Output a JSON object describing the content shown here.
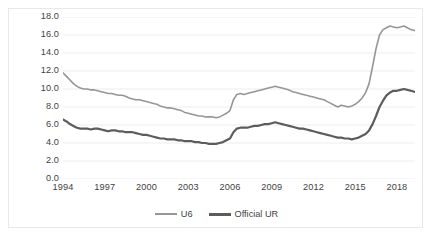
{
  "chart_data": {
    "type": "line",
    "title": "",
    "subtitle": "",
    "xlabel": "",
    "ylabel": "",
    "xlim": [
      1994.0,
      2019.3
    ],
    "ylim": [
      0.0,
      18.0
    ],
    "grid": true,
    "grid_axis": "y",
    "legend_position": "bottom",
    "x_tick_labels": [
      "1994",
      "1997",
      "2000",
      "2003",
      "2006",
      "2009",
      "2012",
      "2015",
      "2018"
    ],
    "x_tick_values": [
      1994,
      1997,
      2000,
      2003,
      2006,
      2009,
      2012,
      2015,
      2018
    ],
    "y_tick_labels": [
      "0.0",
      "2.0",
      "4.0",
      "6.0",
      "8.0",
      "10.0",
      "12.0",
      "14.0",
      "16.0",
      "18.0"
    ],
    "y_tick_values": [
      0.0,
      2.0,
      4.0,
      6.0,
      8.0,
      10.0,
      12.0,
      14.0,
      16.0,
      18.0
    ],
    "x_step": 0.25,
    "x_start": 1994.0,
    "series": [
      {
        "name": "U6",
        "color": "#969696",
        "width": 1.6,
        "values": [
          11.8,
          11.4,
          11.0,
          10.6,
          10.3,
          10.1,
          10.0,
          10.0,
          9.9,
          9.9,
          9.8,
          9.7,
          9.6,
          9.5,
          9.5,
          9.4,
          9.3,
          9.3,
          9.2,
          9.0,
          8.9,
          8.8,
          8.8,
          8.7,
          8.6,
          8.5,
          8.4,
          8.3,
          8.1,
          8.0,
          7.9,
          7.9,
          7.8,
          7.7,
          7.6,
          7.4,
          7.3,
          7.2,
          7.1,
          7.0,
          7.0,
          6.9,
          6.9,
          6.9,
          6.8,
          6.9,
          7.1,
          7.3,
          7.6,
          8.8,
          9.4,
          9.5,
          9.4,
          9.5,
          9.6,
          9.7,
          9.8,
          9.9,
          10.0,
          10.1,
          10.2,
          10.3,
          10.2,
          10.1,
          10.0,
          9.9,
          9.7,
          9.6,
          9.5,
          9.4,
          9.3,
          9.2,
          9.1,
          9.0,
          8.9,
          8.8,
          8.6,
          8.4,
          8.2,
          8.0,
          8.2,
          8.1,
          8.0,
          8.1,
          8.3,
          8.6,
          9.0,
          9.6,
          10.6,
          12.5,
          14.5,
          16.0,
          16.6,
          16.8,
          17.0,
          16.9,
          16.8,
          16.9,
          17.0,
          16.8,
          16.6,
          16.5,
          16.4,
          16.3,
          16.2,
          16.0,
          15.7,
          15.5,
          15.3,
          15.2,
          15.0,
          14.8,
          14.6,
          14.5,
          14.4,
          14.3,
          14.1,
          13.9,
          13.7,
          13.5,
          13.3,
          13.1,
          12.9,
          12.7,
          12.5,
          12.2,
          12.0,
          11.8,
          11.5,
          11.3,
          11.1,
          11.0,
          10.9,
          10.7,
          10.5,
          10.3,
          10.2,
          10.0,
          9.9,
          9.8,
          9.7,
          9.6,
          9.5,
          9.4,
          9.3,
          9.1,
          9.0,
          8.9,
          8.8,
          8.6,
          8.5,
          8.3,
          8.2,
          8.1,
          8.0,
          7.9,
          7.8,
          7.7,
          7.6,
          7.5,
          7.4,
          7.3,
          7.3,
          7.5,
          7.3,
          7.1,
          7.0,
          7.2
        ]
      },
      {
        "name": "Official UR",
        "color": "#5c5c5c",
        "width": 2.2,
        "values": [
          6.6,
          6.4,
          6.1,
          5.9,
          5.7,
          5.6,
          5.6,
          5.6,
          5.5,
          5.6,
          5.6,
          5.5,
          5.4,
          5.3,
          5.4,
          5.4,
          5.3,
          5.3,
          5.2,
          5.2,
          5.2,
          5.1,
          5.0,
          4.9,
          4.9,
          4.8,
          4.7,
          4.6,
          4.5,
          4.5,
          4.4,
          4.4,
          4.4,
          4.3,
          4.3,
          4.2,
          4.2,
          4.2,
          4.1,
          4.1,
          4.0,
          4.0,
          3.9,
          3.9,
          3.9,
          4.0,
          4.1,
          4.3,
          4.5,
          5.2,
          5.6,
          5.7,
          5.7,
          5.7,
          5.8,
          5.9,
          5.9,
          6.0,
          6.1,
          6.1,
          6.2,
          6.3,
          6.2,
          6.1,
          6.0,
          5.9,
          5.8,
          5.7,
          5.6,
          5.6,
          5.5,
          5.4,
          5.3,
          5.2,
          5.1,
          5.0,
          4.9,
          4.8,
          4.7,
          4.6,
          4.6,
          4.5,
          4.5,
          4.4,
          4.5,
          4.6,
          4.8,
          5.0,
          5.4,
          6.1,
          7.0,
          8.0,
          8.7,
          9.3,
          9.6,
          9.8,
          9.8,
          9.9,
          10.0,
          9.9,
          9.8,
          9.7,
          9.6,
          9.5,
          9.5,
          9.5,
          9.4,
          9.6,
          9.5,
          9.3,
          9.1,
          9.0,
          8.9,
          8.7,
          8.6,
          8.5,
          8.3,
          8.2,
          8.2,
          8.1,
          8.1,
          8.0,
          7.9,
          7.8,
          7.7,
          7.6,
          7.5,
          7.4,
          7.3,
          7.2,
          7.0,
          6.9,
          6.8,
          6.7,
          6.6,
          6.4,
          6.3,
          6.2,
          6.1,
          6.0,
          5.9,
          5.8,
          5.7,
          5.6,
          5.5,
          5.4,
          5.3,
          5.2,
          5.1,
          5.0,
          4.9,
          4.9,
          4.8,
          4.7,
          4.6,
          4.5,
          4.4,
          4.3,
          4.2,
          4.1,
          4.0,
          3.9,
          3.9,
          3.8,
          3.7,
          3.7,
          3.6,
          3.5
        ]
      }
    ]
  },
  "legend": {
    "items": [
      {
        "label": "U6",
        "color": "#969696"
      },
      {
        "label": "Official UR",
        "color": "#5c5c5c"
      }
    ]
  }
}
